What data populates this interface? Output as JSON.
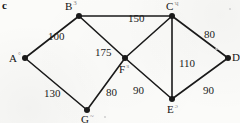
{
  "figure": {
    "label": "c",
    "background_color": "#fbfbf9",
    "ink_color": "#1a1a1a"
  },
  "chart_data": {
    "type": "diagram",
    "diagram_kind": "weighted-undirected-graph",
    "title": "c",
    "xlabel": "",
    "ylabel": "",
    "grid": false,
    "legend": null,
    "nodes": [
      {
        "id": "A",
        "label": "A",
        "mark": "°",
        "x": 25,
        "y": 58,
        "label_dx": -16,
        "label_dy": -7
      },
      {
        "id": "B",
        "label": "B",
        "mark": "3",
        "x": 79,
        "y": 16,
        "label_dx": -14,
        "label_dy": -17
      },
      {
        "id": "C",
        "label": "C",
        "mark": "ʮ",
        "x": 172,
        "y": 16,
        "label_dx": -6,
        "label_dy": -17
      },
      {
        "id": "D",
        "label": "D",
        "mark": "",
        "x": 228,
        "y": 58,
        "label_dx": 4,
        "label_dy": -7
      },
      {
        "id": "E",
        "label": "E",
        "mark": "ɔ",
        "x": 172,
        "y": 99,
        "label_dx": -5,
        "label_dy": 3
      },
      {
        "id": "F",
        "label": "F",
        "mark": "ɜ",
        "x": 125,
        "y": 58,
        "label_dx": -6,
        "label_dy": 4
      },
      {
        "id": "G",
        "label": "G",
        "mark": "~",
        "x": 87,
        "y": 110,
        "label_dx": -6,
        "label_dy": 2
      }
    ],
    "edges": [
      {
        "from": "A",
        "to": "B",
        "weight": 100,
        "label_x": 48,
        "label_y": 30
      },
      {
        "from": "B",
        "to": "C",
        "weight": 150,
        "label_x": 128,
        "label_y": 12
      },
      {
        "from": "B",
        "to": "F",
        "weight": 175,
        "label_x": 95,
        "label_y": 46
      },
      {
        "from": "C",
        "to": "D",
        "weight": 80,
        "label_x": 204,
        "label_y": 28
      },
      {
        "from": "C",
        "to": "E",
        "weight": 110,
        "label_x": 179,
        "label_y": 57
      },
      {
        "from": "C",
        "to": "F",
        "weight": null,
        "label_x": null,
        "label_y": null
      },
      {
        "from": "A",
        "to": "G",
        "weight": 130,
        "label_x": 44,
        "label_y": 87
      },
      {
        "from": "G",
        "to": "F",
        "weight": 80,
        "label_x": 106,
        "label_y": 86
      },
      {
        "from": "F",
        "to": "E",
        "weight": 90,
        "label_x": 133,
        "label_y": 84
      },
      {
        "from": "E",
        "to": "D",
        "weight": 90,
        "label_x": 203,
        "label_y": 84
      }
    ],
    "node_count": 7,
    "edge_count": 10,
    "weights": [
      100,
      150,
      175,
      80,
      110,
      130,
      80,
      90,
      90
    ]
  }
}
